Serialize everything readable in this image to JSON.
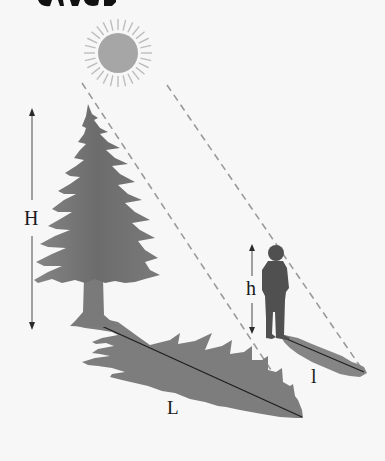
{
  "diagram": {
    "title_fragment": "cut-off heading strokes at top edge",
    "labels": {
      "tree_height": "H",
      "tree_shadow": "L",
      "person_height": "h",
      "person_shadow": "l"
    },
    "elements": {
      "sun": {
        "cx": 118,
        "cy": 53,
        "r": 20,
        "ray_length": 14,
        "ray_count": 28
      },
      "sun_ray_lines": [
        {
          "x1": 82,
          "y1": 83,
          "x2": 302,
          "y2": 417
        },
        {
          "x1": 167,
          "y1": 85,
          "x2": 364,
          "y2": 372
        }
      ],
      "tree": {
        "apex": [
          88,
          104
        ],
        "base": [
          95,
          325
        ]
      },
      "tree_shadow_line": {
        "x1": 95,
        "y1": 323,
        "x2": 302,
        "y2": 417
      },
      "person": {
        "head": [
          275,
          252
        ],
        "feet": [
          278,
          336
        ]
      },
      "person_shadow_line": {
        "x1": 280,
        "y1": 336,
        "x2": 364,
        "y2": 372
      },
      "H_arrow": {
        "x": 32,
        "y1": 110,
        "y2": 328
      },
      "h_arrow": {
        "x": 252,
        "y1": 245,
        "y2": 333
      }
    },
    "colors": {
      "background": "#f7f7f7",
      "sun_fill": "#a6a6a6",
      "sun_rays": "#bdbdbd",
      "tree_fill": "#7a7a7a",
      "tree_dark": "#6a6a6a",
      "shadow_fill": "#7d7d7d",
      "person_fill": "#505050",
      "dashed_line": "#9a9a9a",
      "arrow": "#4a4a4a",
      "text": "#1a1a1a"
    }
  }
}
